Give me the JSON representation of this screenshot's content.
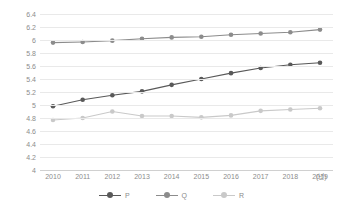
{
  "chart_data": {
    "type": "line",
    "title": "",
    "xlabel": "",
    "ylabel": "",
    "x_unit": "(년)",
    "categories": [
      "2010",
      "2011",
      "2012",
      "2013",
      "2014",
      "2015",
      "2016",
      "2017",
      "2018",
      "2019"
    ],
    "ylim": [
      4,
      6.4
    ],
    "y_ticks": [
      "6.4",
      "6.2",
      "6",
      "5.8",
      "5.6",
      "5.4",
      "5.2",
      "5",
      "4.8",
      "4.6",
      "4.4",
      "4.2",
      "4"
    ],
    "y_tick_values": [
      6.4,
      6.2,
      6.0,
      5.8,
      5.6,
      5.4,
      5.2,
      5.0,
      4.8,
      4.6,
      4.4,
      4.2,
      4.0
    ],
    "grid": true,
    "legend_position": "bottom",
    "series": [
      {
        "name": "P",
        "color": "#595959",
        "values": [
          4.98,
          5.08,
          5.15,
          5.21,
          5.31,
          5.4,
          5.49,
          5.57,
          5.62,
          5.65
        ]
      },
      {
        "name": "Q",
        "color": "#8c8c8c",
        "values": [
          5.96,
          5.97,
          5.99,
          6.02,
          6.04,
          6.05,
          6.08,
          6.1,
          6.12,
          6.16
        ]
      },
      {
        "name": "R",
        "color": "#c9c9c9",
        "values": [
          4.77,
          4.8,
          4.9,
          4.83,
          4.83,
          4.81,
          4.84,
          4.91,
          4.93,
          4.95
        ]
      }
    ]
  },
  "legend": {
    "items": [
      {
        "label": "P"
      },
      {
        "label": "Q"
      },
      {
        "label": "R"
      }
    ]
  },
  "colors": {
    "gridline": "#e9e9e9",
    "axis": "#d0d0d0",
    "tick_text": "#8c8c8c",
    "background": "#ffffff"
  }
}
